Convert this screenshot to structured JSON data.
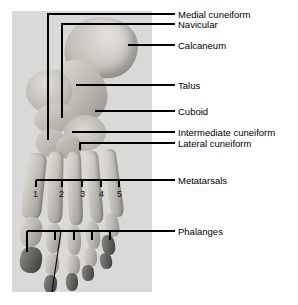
{
  "figure": {
    "name": "labelled-photograph-of-human-foot-skeleton",
    "photo": {
      "alt_name": "foot-skeleton-photo",
      "background_color": "#d9d9d7"
    },
    "labels": [
      {
        "id": "medial-cuneiform",
        "text": "Medial cuneiform",
        "x": 178,
        "y": 10
      },
      {
        "id": "navicular",
        "text": "Navicular",
        "x": 178,
        "y": 21
      },
      {
        "id": "calcaneum",
        "text": "Calcaneum",
        "x": 178,
        "y": 41
      },
      {
        "id": "talus",
        "text": "Talus",
        "x": 178,
        "y": 81
      },
      {
        "id": "cuboid",
        "text": "Cuboid",
        "x": 178,
        "y": 107
      },
      {
        "id": "intermediate-cuneiform",
        "text": "Intermediate cuneiform",
        "x": 178,
        "y": 128
      },
      {
        "id": "lateral-cuneiform",
        "text": "Lateral cuneiform",
        "x": 178,
        "y": 139
      },
      {
        "id": "metatarsals",
        "text": "Metatarsals",
        "x": 178,
        "y": 175
      },
      {
        "id": "phalanges",
        "text": "Phalanges",
        "x": 178,
        "y": 226
      }
    ],
    "metatarsal_numbers": [
      {
        "id": "metatarsal-1",
        "text": "1",
        "x": 33,
        "y": 190
      },
      {
        "id": "metatarsal-2",
        "text": "2",
        "x": 59,
        "y": 190
      },
      {
        "id": "metatarsal-3",
        "text": "3",
        "x": 81,
        "y": 190
      },
      {
        "id": "metatarsal-4",
        "text": "4",
        "x": 100,
        "y": 190
      },
      {
        "id": "metatarsal-5",
        "text": "5",
        "x": 118,
        "y": 190
      }
    ],
    "line_color": "#000000"
  }
}
